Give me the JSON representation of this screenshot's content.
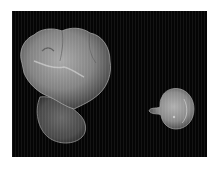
{
  "image": {
    "description": "Photograph of two specimens on a black background",
    "background_color": "#050505",
    "page_color": "#ffffff",
    "objects": [
      {
        "name": "large lobed specimen",
        "color": "#8a8a8a",
        "highlight_color": "#bdbdbd"
      },
      {
        "name": "small round specimen",
        "color": "#8f8f8f",
        "highlight_color": "#c8c8c8"
      }
    ]
  }
}
